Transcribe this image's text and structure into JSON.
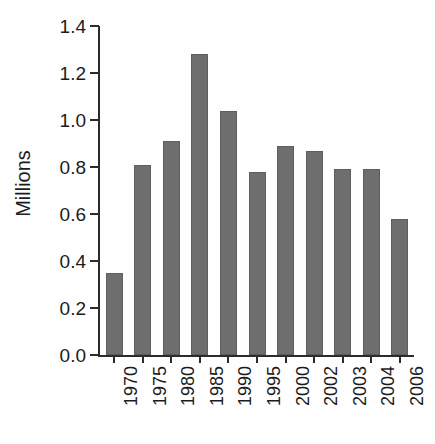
{
  "chart_data": {
    "type": "bar",
    "title": "",
    "subtitle": "",
    "xlabel": "",
    "ylabel": "Millions",
    "categories": [
      "1970",
      "1975",
      "1980",
      "1985",
      "1990",
      "1995",
      "2000",
      "2002",
      "2003",
      "2004",
      "2006"
    ],
    "values": [
      0.35,
      0.81,
      0.91,
      1.28,
      1.04,
      0.78,
      0.89,
      0.87,
      0.79,
      0.79,
      0.58
    ],
    "series": [
      {
        "name": "Millions",
        "values": [
          0.35,
          0.81,
          0.91,
          1.28,
          1.04,
          0.78,
          0.89,
          0.87,
          0.79,
          0.79,
          0.58
        ]
      }
    ],
    "ylim": [
      0.0,
      1.4
    ],
    "ytick_values": [
      0.0,
      0.2,
      0.4,
      0.6,
      0.8,
      1.0,
      1.2,
      1.4
    ],
    "ytick_labels": [
      "0.0",
      "0.2",
      "0.4",
      "0.6",
      "0.8",
      "1.0",
      "1.2",
      "1.4"
    ],
    "grid": false,
    "legend": "none",
    "bar_color": "#6e6e6e",
    "axis_color": "#2b2b2b",
    "background_color": "#fefefe",
    "xtick_label_rotation": "90"
  }
}
